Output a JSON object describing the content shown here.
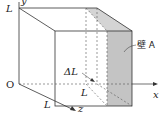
{
  "diagram": {
    "labels": {
      "origin": "O",
      "y_axis": "y",
      "x_axis": "x",
      "z_axis": "z",
      "side_y": "L",
      "side_z": "L",
      "slab_length": "L",
      "slab_thickness": "ΔL",
      "wall": "壁 A"
    },
    "colors": {
      "line": "#333333",
      "shade": "#c8c8c8",
      "background": "#ffffff"
    }
  }
}
